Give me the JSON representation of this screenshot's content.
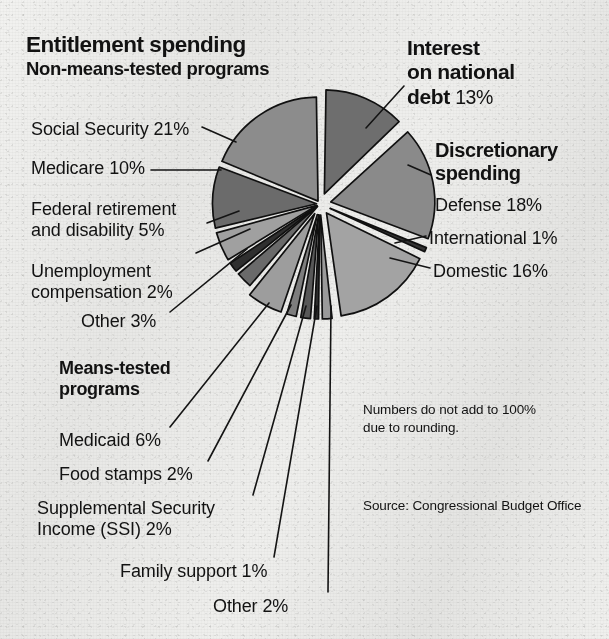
{
  "headings": {
    "entitlement_title": "Entitlement spending",
    "entitlement_subtitle": "Non-means-tested programs",
    "means_tested_title": "Means-tested\nprograms",
    "discretionary_title": "Discretionary\nspending",
    "interest_title": "Interest\non national\ndebt ",
    "interest_value": "13%"
  },
  "labels": {
    "social_security": "Social Security 21%",
    "medicare": "Medicare 10%",
    "federal_retirement": "Federal retirement\nand disability 5%",
    "unemployment": "Unemployment\ncompensation 2%",
    "other_nonmeans": "Other 3%",
    "medicaid": "Medicaid 6%",
    "food_stamps": "Food stamps 2%",
    "ssi": "Supplemental Security\nIncome (SSI) 2%",
    "family_support": "Family support 1%",
    "other_means": "Other 2%",
    "defense": "Defense 18%",
    "international": "International 1%",
    "domestic": "Domestic 16%"
  },
  "notes": {
    "rounding": "Numbers do not add to 100%\ndue to rounding.",
    "source": "Source: Congressional Budget Office"
  },
  "colors": {
    "ink": "#121212",
    "background": "#ececea",
    "dark_gray": "#6e6e6e",
    "mid_gray": "#8f8f8f",
    "light_gray": "#a8a8a8",
    "very_dark": "#3a3a3a",
    "stroke": "#101010"
  },
  "chart_data": {
    "type": "pie",
    "unit": "percent of federal spending",
    "total_labeled": 100,
    "legend_position": "callout-labels",
    "grid": false,
    "groups": [
      {
        "name": "Entitlement spending — Non-means-tested programs",
        "slices": [
          "Social Security",
          "Medicare",
          "Federal retirement and disability",
          "Unemployment compensation",
          "Other"
        ]
      },
      {
        "name": "Entitlement spending — Means-tested programs",
        "slices": [
          "Medicaid",
          "Food stamps",
          "Supplemental Security Income (SSI)",
          "Family support",
          "Other"
        ]
      },
      {
        "name": "Discretionary spending",
        "slices": [
          "Defense",
          "International",
          "Domestic"
        ]
      },
      {
        "name": "Interest",
        "slices": [
          "Interest on national debt"
        ]
      }
    ],
    "categories": [
      "Interest on national debt",
      "Defense",
      "International",
      "Domestic",
      "Other (means-tested)",
      "Family support",
      "Supplemental Security Income (SSI)",
      "Food stamps",
      "Medicaid",
      "Other (non-means-tested)",
      "Unemployment compensation",
      "Federal retirement and disability",
      "Medicare",
      "Social Security"
    ],
    "values": [
      13,
      18,
      1,
      16,
      2,
      1,
      2,
      2,
      6,
      3,
      2,
      5,
      10,
      21
    ],
    "slices": [
      {
        "label": "Interest on national debt",
        "value": 13,
        "display": "13%",
        "fill": "#6e6e6e",
        "start_deg": 0,
        "end_deg": 46.8,
        "exploded": true
      },
      {
        "label": "Defense",
        "value": 18,
        "display": "18%",
        "fill": "#8a8a8a",
        "start_deg": 46.8,
        "end_deg": 111.6,
        "exploded": true
      },
      {
        "label": "International",
        "value": 1,
        "display": "1%",
        "fill": "#333333",
        "start_deg": 111.6,
        "end_deg": 115.2,
        "exploded": true
      },
      {
        "label": "Domestic",
        "value": 16,
        "display": "16%",
        "fill": "#a3a3a3",
        "start_deg": 115.2,
        "end_deg": 172.8,
        "exploded": true
      },
      {
        "label": "Other (means-tested)",
        "value": 2,
        "display": "2%",
        "fill": "#9a9a9a",
        "start_deg": 172.8,
        "end_deg": 180.0,
        "exploded": true
      },
      {
        "label": "Family support",
        "value": 1,
        "display": "1%",
        "fill": "#2e2e2e",
        "start_deg": 180.0,
        "end_deg": 183.6,
        "exploded": true
      },
      {
        "label": "Supplemental Security Income (SSI)",
        "value": 2,
        "display": "2%",
        "fill": "#585858",
        "start_deg": 183.6,
        "end_deg": 190.8,
        "exploded": true
      },
      {
        "label": "Food stamps",
        "value": 2,
        "display": "2%",
        "fill": "#7d7d7d",
        "start_deg": 190.8,
        "end_deg": 198.0,
        "exploded": true
      },
      {
        "label": "Medicaid",
        "value": 6,
        "display": "6%",
        "fill": "#9d9d9d",
        "start_deg": 198.0,
        "end_deg": 219.6,
        "exploded": true
      },
      {
        "label": "Other (non-means-tested)",
        "value": 3,
        "display": "3%",
        "fill": "#6a6a6a",
        "start_deg": 219.6,
        "end_deg": 230.4,
        "exploded": false
      },
      {
        "label": "Unemployment compensation",
        "value": 2,
        "display": "2%",
        "fill": "#2f2f2f",
        "start_deg": 230.4,
        "end_deg": 237.6,
        "exploded": false
      },
      {
        "label": "Federal retirement and disability",
        "value": 5,
        "display": "5%",
        "fill": "#a0a0a0",
        "start_deg": 237.6,
        "end_deg": 255.6,
        "exploded": false
      },
      {
        "label": "Medicare",
        "value": 10,
        "display": "10%",
        "fill": "#6b6b6b",
        "start_deg": 255.6,
        "end_deg": 291.6,
        "exploded": false
      },
      {
        "label": "Social Security",
        "value": 21,
        "display": "21%",
        "fill": "#8c8c8c",
        "start_deg": 291.6,
        "end_deg": 360.0,
        "exploded": false
      }
    ],
    "annotations": [
      "Numbers do not add to 100% due to rounding.",
      "Source: Congressional Budget Office"
    ]
  }
}
